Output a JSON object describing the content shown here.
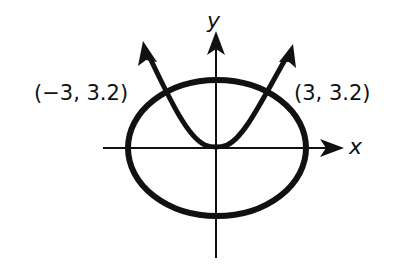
{
  "diagram": {
    "type": "graph-of-intersecting-curves",
    "axes": {
      "x_label": "x",
      "y_label": "y"
    },
    "curves": [
      {
        "kind": "ellipse",
        "description": "ellipse centered at origin"
      },
      {
        "kind": "parabola",
        "description": "upward-opening parabola with vertex at origin, arrows on both ends"
      }
    ],
    "intersection_points": [
      {
        "label": "(−3, 3.2)",
        "x": -3,
        "y": 3.2
      },
      {
        "label": "(3, 3.2)",
        "x": 3,
        "y": 3.2
      }
    ],
    "colors": {
      "stroke": "#111111",
      "background": "#ffffff"
    }
  }
}
